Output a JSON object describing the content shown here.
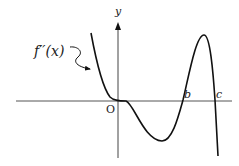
{
  "figure": {
    "function_label": "f′′(x)",
    "y_axis_label": "y",
    "origin_label": "O",
    "root_labels": [
      "b",
      "c"
    ],
    "colors": {
      "curve": "#111111",
      "axis": "#555555",
      "text": "#222222"
    }
  }
}
